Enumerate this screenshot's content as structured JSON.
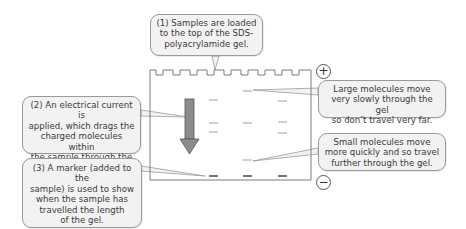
{
  "diagram": {
    "callouts": {
      "step1": [
        "(1) Samples are loaded",
        "to the top of the SDS-",
        "polyacrylamide gel."
      ],
      "step2": [
        "(2) An electrical current is",
        "applied, which drags the",
        "charged molecules within",
        "the sample through the gel."
      ],
      "step3": [
        "(3) A marker (added to the",
        "sample) is used to show",
        "when the sample has",
        "travelled the length",
        "of the gel."
      ],
      "large": [
        "Large molecules move",
        "very slowly through the gel",
        "so don’t travel very far."
      ],
      "small": [
        "Small molecules move",
        "more quickly and so travel",
        "further through the gel."
      ]
    },
    "electrodes": {
      "positive": "+",
      "negative": "−"
    },
    "gel": {
      "wells": 9,
      "lanes": [
        {
          "x": 213,
          "bands_y": [
            100,
            123,
            132
          ],
          "marker_y": 176
        },
        {
          "x": 247,
          "bands_y": [
            91,
            123,
            160
          ],
          "marker_y": 176
        },
        {
          "x": 282,
          "bands_y": [
            101,
            122,
            133
          ],
          "marker_y": 176
        }
      ]
    },
    "arrow": {
      "direction": "down",
      "color": "#8c8c8c"
    },
    "colors": {
      "callout_bg": "#f2f2f2",
      "callout_border": "#9a9a9a",
      "gel_outline": "#7a7a7a",
      "band": "#b5b5b5",
      "marker_band": "#555555"
    }
  }
}
